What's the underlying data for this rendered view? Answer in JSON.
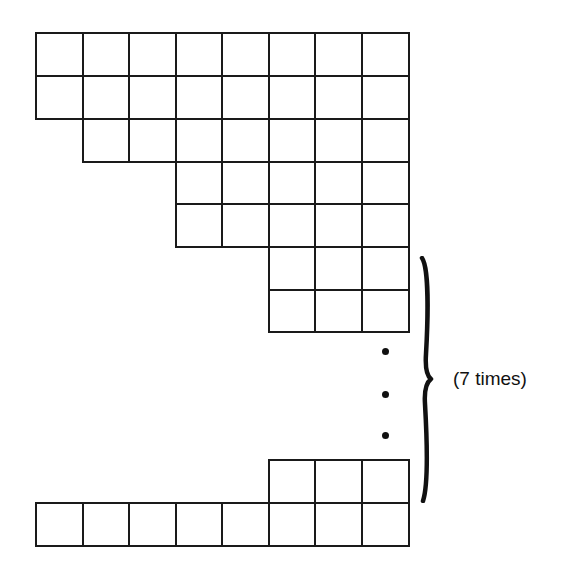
{
  "diagram": {
    "columns": 8,
    "line_color": "#1a1a1a",
    "background": "#ffffff",
    "column_x": [
      36,
      83,
      129,
      176,
      222,
      269,
      315,
      362,
      409
    ],
    "rows": [
      {
        "name": "row-1",
        "y": 33,
        "h": 43,
        "start_col": 0,
        "end_col": 8,
        "cells": 8
      },
      {
        "name": "row-2",
        "y": 76,
        "h": 43,
        "start_col": 0,
        "end_col": 8,
        "cells": 8
      },
      {
        "name": "row-3",
        "y": 119,
        "h": 43,
        "start_col": 1,
        "end_col": 8,
        "cells": 7
      },
      {
        "name": "row-4",
        "y": 162,
        "h": 42,
        "start_col": 3,
        "end_col": 8,
        "cells": 5
      },
      {
        "name": "row-5",
        "y": 204,
        "h": 43,
        "start_col": 3,
        "end_col": 8,
        "cells": 5
      },
      {
        "name": "row-6",
        "y": 247,
        "h": 43,
        "start_col": 5,
        "end_col": 8,
        "cells": 3
      },
      {
        "name": "row-7",
        "y": 290,
        "h": 42,
        "start_col": 5,
        "end_col": 8,
        "cells": 3
      },
      {
        "name": "row-repeat-last",
        "y": 460,
        "h": 43,
        "start_col": 5,
        "end_col": 8,
        "cells": 3
      },
      {
        "name": "row-bottom",
        "y": 503,
        "h": 43,
        "start_col": 0,
        "end_col": 8,
        "cells": 8
      }
    ],
    "ellipsis": {
      "symbol": "vertical-ellipsis",
      "dots": [
        {
          "x": 385,
          "y": 351
        },
        {
          "x": 385,
          "y": 394
        },
        {
          "x": 385,
          "y": 435
        }
      ]
    },
    "brace": {
      "symbol": "right-curly-brace",
      "top": 258,
      "bottom": 501,
      "x": 425,
      "tip_y": 379
    },
    "annotation": {
      "text": "(7 times)",
      "x": 453,
      "y": 369
    }
  }
}
